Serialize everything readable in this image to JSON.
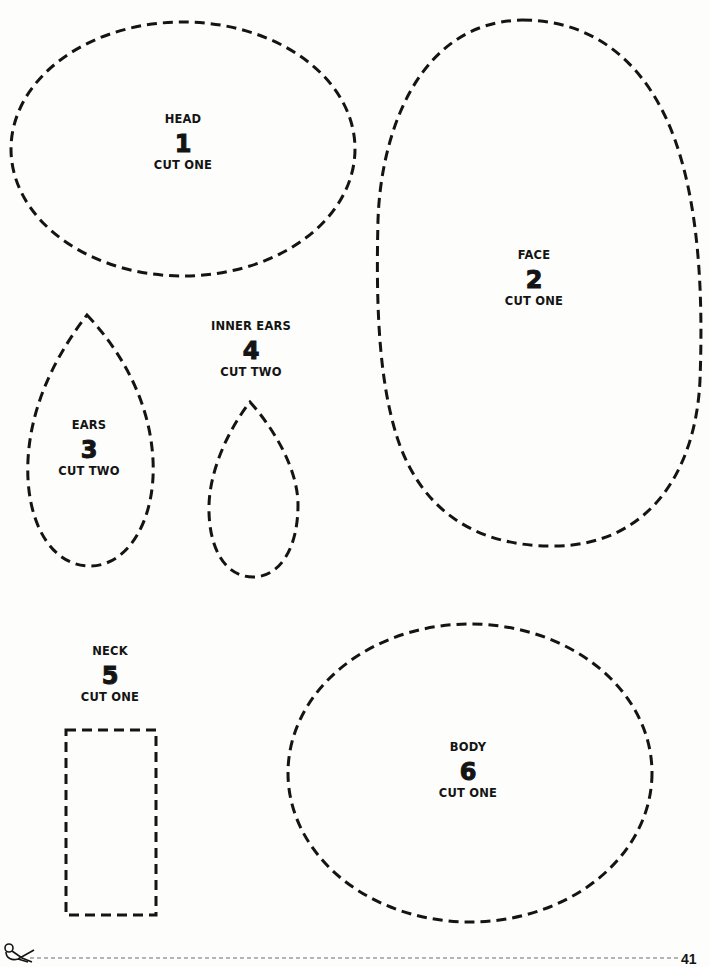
{
  "document": {
    "type": "craft-pattern-template",
    "page_number": "41",
    "cut_line": {
      "icon": "scissors-icon",
      "style": "dashed"
    }
  },
  "pieces": [
    {
      "id": "head",
      "name": "HEAD",
      "number": "1",
      "quantity": "CUT ONE",
      "shape": "ellipse"
    },
    {
      "id": "face",
      "name": "FACE",
      "number": "2",
      "quantity": "CUT ONE",
      "shape": "egg"
    },
    {
      "id": "ears",
      "name": "EARS",
      "number": "3",
      "quantity": "CUT TWO",
      "shape": "teardrop"
    },
    {
      "id": "inner-ears",
      "name": "INNER EARS",
      "number": "4",
      "quantity": "CUT TWO",
      "shape": "teardrop"
    },
    {
      "id": "neck",
      "name": "NECK",
      "number": "5",
      "quantity": "CUT ONE",
      "shape": "rectangle"
    },
    {
      "id": "body",
      "name": "BODY",
      "number": "6",
      "quantity": "CUT ONE",
      "shape": "ellipse"
    }
  ],
  "colors": {
    "paper": "#fdfdfb",
    "ink": "#141414",
    "cut_line": "#6a6a78"
  }
}
